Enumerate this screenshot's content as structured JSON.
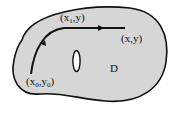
{
  "diagram": {
    "region_label": "D",
    "start_point": {
      "label_main": "(x",
      "sub1": "0",
      "mid": ",y",
      "sub2": "0",
      "end": ")"
    },
    "corner_point": {
      "label_main": "(x",
      "sub1": "1",
      "end": ",y)"
    },
    "end_point": {
      "label": "(x,y)"
    },
    "colors": {
      "fill": "#d6d6d6",
      "stroke": "#111111",
      "hole": "#ffffff"
    }
  }
}
